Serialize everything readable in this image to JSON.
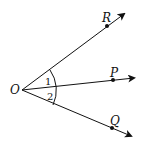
{
  "figure": {
    "vertex": "O",
    "rays": [
      {
        "name": "R",
        "label": "R"
      },
      {
        "name": "P",
        "label": "P"
      },
      {
        "name": "Q",
        "label": "Q"
      }
    ],
    "angles": [
      {
        "label": "1",
        "between": "OR-OP"
      },
      {
        "label": "2",
        "between": "OP-OQ"
      }
    ],
    "color": "#111111"
  }
}
